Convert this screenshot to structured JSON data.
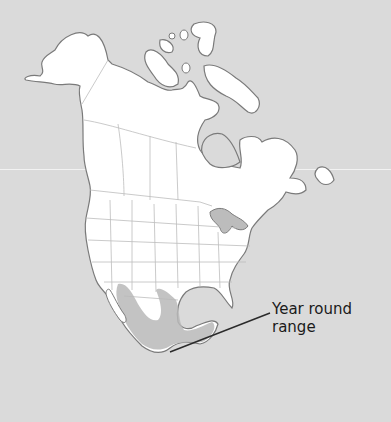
{
  "map": {
    "region": "North America",
    "colors": {
      "background": "#dadada",
      "land": "#ffffff",
      "coast_stroke": "#7a7a7a",
      "border_stroke": "#bdbdbd",
      "range_fill": "#b9b9b9",
      "leader_line": "#2a2a2a"
    },
    "legend": {
      "range_label_line1": "Year round",
      "range_label_line2": "range"
    }
  }
}
